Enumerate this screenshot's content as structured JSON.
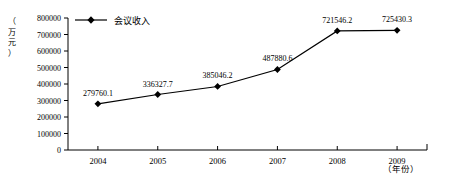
{
  "chart_data": {
    "type": "line",
    "title": "",
    "subtitle": "",
    "xlabel": "（年份）",
    "ylabel": "（万元）",
    "categories": [
      "2004",
      "2005",
      "2006",
      "2007",
      "2008",
      "2009"
    ],
    "series": [
      {
        "name": "会议收入",
        "values": [
          279760.1,
          336327.7,
          385046.2,
          487880.6,
          721546.2,
          725430.3
        ],
        "point_labels": [
          "279760.1",
          "336327.7",
          "385046.2",
          "487880.6",
          "721546.2",
          "725430.3"
        ],
        "color": "#000000",
        "marker": "diamond"
      }
    ],
    "ylim": [
      0,
      800000
    ],
    "ytick_step": 100000,
    "ytick_labels": [
      "0",
      "100000",
      "200000",
      "300000",
      "400000",
      "500000",
      "600000",
      "700000",
      "800000"
    ],
    "grid": false,
    "legend": {
      "position": "top-left",
      "entries": [
        "会议收入"
      ]
    },
    "background": "#ffffff",
    "axis_color": "#000000"
  },
  "ylabel_chars": [
    "（",
    "万",
    "元",
    "）"
  ]
}
